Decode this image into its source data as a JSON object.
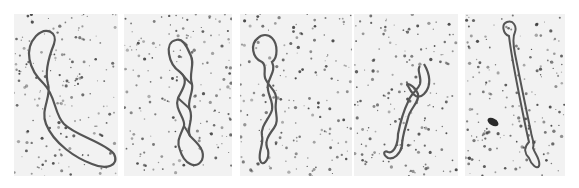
{
  "figure": {
    "background_color": "#ffffff",
    "panel_color": "#f2f2f2",
    "molecule_color": "#555555",
    "grain_color": "#3a3a3a",
    "panels": [
      {
        "index": 1,
        "state": "relaxed-open-circle",
        "x": 14,
        "width": 104
      },
      {
        "index": 2,
        "state": "few-twists",
        "x": 124,
        "width": 108
      },
      {
        "index": 3,
        "state": "more-twists",
        "x": 240,
        "width": 112
      },
      {
        "index": 4,
        "state": "tightly-coiled",
        "x": 354,
        "width": 104
      },
      {
        "index": 5,
        "state": "fully-supercoiled",
        "x": 465,
        "width": 100
      }
    ]
  }
}
